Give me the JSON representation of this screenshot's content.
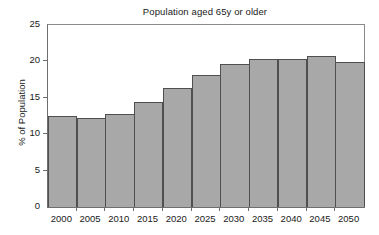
{
  "chart_data": {
    "type": "bar",
    "title": "Population aged 65y or older",
    "xlabel": "",
    "ylabel": "% of Population",
    "categories": [
      "2000",
      "2005",
      "2010",
      "2015",
      "2020",
      "2025",
      "2030",
      "2035",
      "2040",
      "2045",
      "2050"
    ],
    "values": [
      12.5,
      12.2,
      12.8,
      14.4,
      16.3,
      18.1,
      19.7,
      20.4,
      20.4,
      20.8,
      19.9
    ],
    "series": [
      {
        "name": "% of Population",
        "values": [
          12.5,
          12.2,
          12.8,
          14.4,
          16.3,
          18.1,
          19.7,
          20.4,
          20.4,
          20.8,
          19.9
        ]
      }
    ],
    "ylim": [
      0,
      25
    ],
    "yticks": [
      0,
      5,
      10,
      15,
      20,
      25
    ],
    "ytick_labels": [
      "0",
      "5",
      "10",
      "15",
      "20",
      "25"
    ],
    "xtick_labels": [
      "2000",
      "2005",
      "2010",
      "2015",
      "2020",
      "2025",
      "2030",
      "2035",
      "2040",
      "2045",
      "2050"
    ],
    "grid": false,
    "legend": false,
    "legend_position": "none",
    "bar_color": "#a8a8a8",
    "bar_edge_color": "#4f4f4f",
    "axis_color": "#6e6e6e",
    "text_color": "#1a1a1a",
    "background_color": "#ffffff",
    "bar_width_fraction": 1.0,
    "annotations": []
  }
}
